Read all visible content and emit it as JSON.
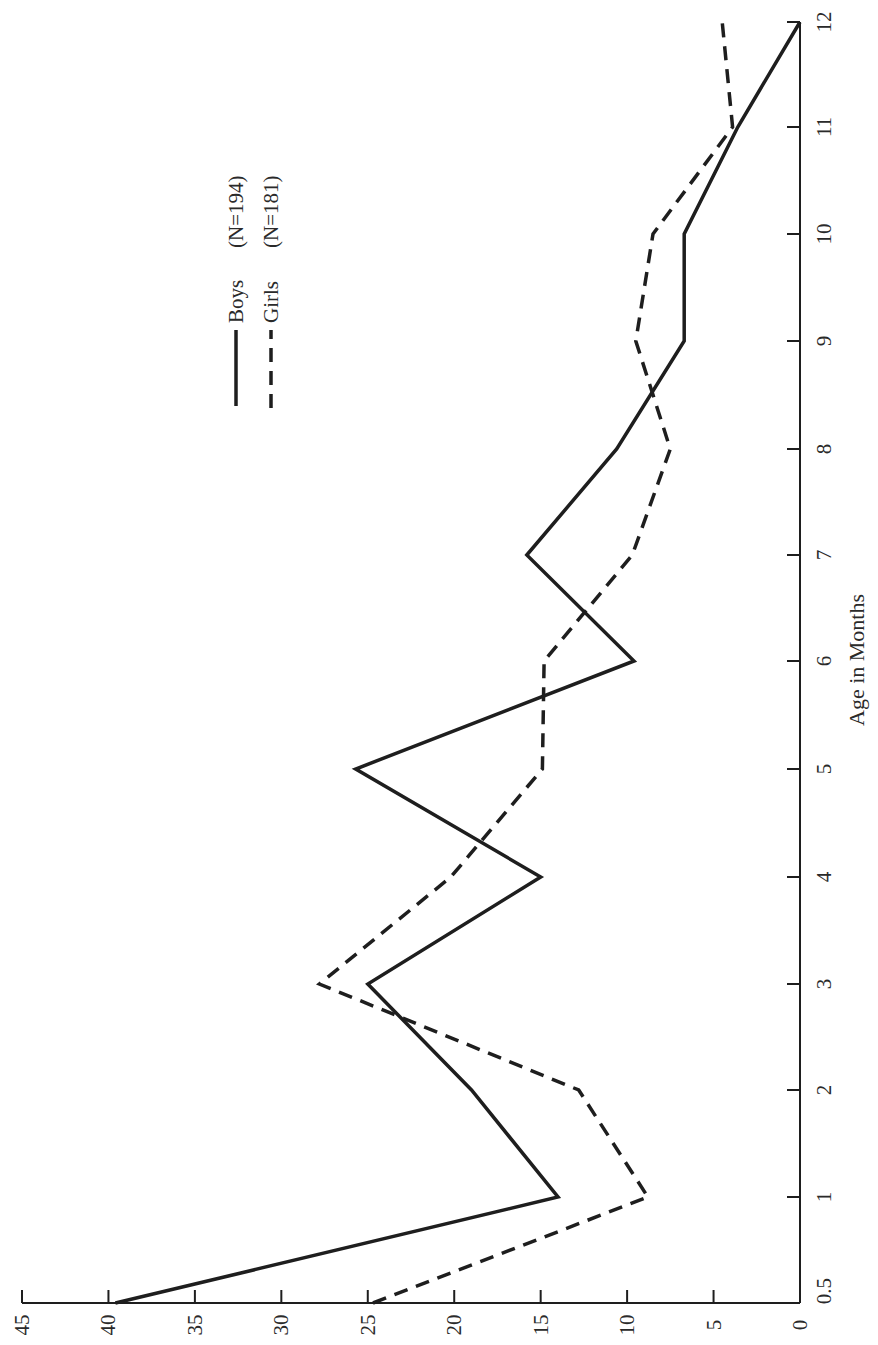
{
  "chart_data": {
    "type": "line",
    "orientation": "rotated-90-ccw",
    "title": "",
    "xlabel": "Age in Months",
    "ylabel": "",
    "x": [
      0.5,
      1,
      2,
      3,
      4,
      5,
      6,
      7,
      8,
      9,
      10,
      11,
      12
    ],
    "x_tick_labels": [
      "0.5",
      "1",
      "2",
      "3",
      "4",
      "5",
      "6",
      "7",
      "8",
      "9",
      "10",
      "11",
      "12"
    ],
    "y_ticks": [
      0,
      5,
      10,
      15,
      20,
      25,
      30,
      35,
      40,
      45
    ],
    "y_tick_labels": [
      "0",
      "5",
      "10",
      "15",
      "20",
      "25",
      "30",
      "35",
      "40",
      "45"
    ],
    "ylim": [
      0,
      45
    ],
    "grid": false,
    "legend_position": "upper-left (rotated)",
    "series": [
      {
        "name": "Boys",
        "n_label": "(N=194)",
        "style": "solid",
        "values": [
          39.6,
          14.0,
          19.0,
          25.0,
          15.0,
          25.7,
          9.6,
          15.8,
          10.6,
          6.7,
          6.7,
          3.6,
          0.0
        ]
      },
      {
        "name": "Girls",
        "n_label": "(N=181)",
        "style": "dashed",
        "values": [
          24.7,
          8.8,
          12.8,
          27.8,
          20.2,
          14.9,
          14.8,
          9.7,
          7.5,
          9.5,
          8.5,
          3.9,
          4.5
        ]
      }
    ]
  },
  "legend": {
    "items": [
      {
        "label": "Boys",
        "n": "(N=194)"
      },
      {
        "label": "Girls",
        "n": "(N=181)"
      }
    ]
  },
  "colors": {
    "ink": "#1e1e1e",
    "background": "#ffffff"
  }
}
